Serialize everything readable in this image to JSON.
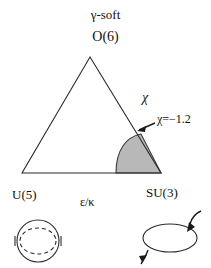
{
  "figure": {
    "title_top": "γ-soft",
    "vertex_top_label": "O(6)",
    "vertex_left_label": "U(5)",
    "vertex_right_label": "SU(3)",
    "axis_label_left_right": "ε/κ",
    "axis_label_right_edge": "χ",
    "annotation_chi_value": "χ=−1.2",
    "colors": {
      "stroke": "#2b2b2b",
      "shaded_region_fill": "#b8b8b8",
      "shaded_region_stroke": "#3a3a3a",
      "background": "#ffffff"
    },
    "geometry": {
      "triangle_apex": [
        90,
        57
      ],
      "triangle_base_left": [
        22,
        173
      ],
      "triangle_base_right": [
        161,
        173
      ],
      "shaded_arc_base_point": [
        116,
        173
      ],
      "shaded_arc_edge_point": [
        141,
        134
      ]
    },
    "icons": {
      "u5_shape": "circle-with-dashed-inner-ellipse",
      "su3_shape": "ellipse-with-rotation-arrows",
      "chi_pointer": "left-arrow"
    }
  }
}
